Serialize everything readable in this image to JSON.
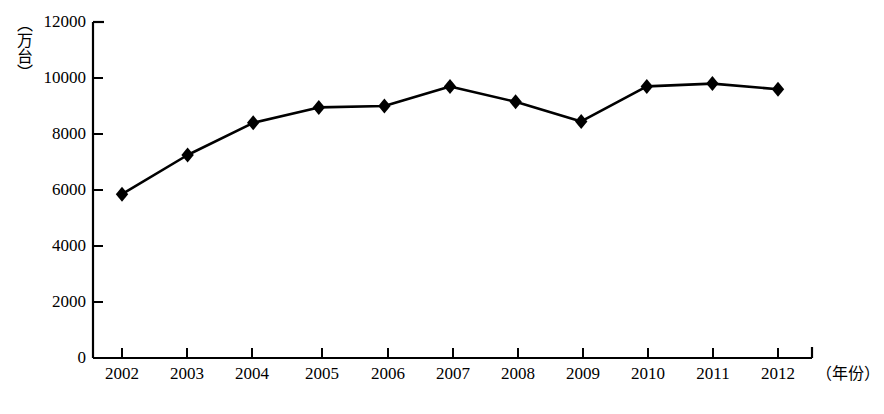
{
  "chart_data": {
    "type": "line",
    "title": "",
    "subtitle": "",
    "xlabel": "（年份）",
    "ylabel": "（万台）",
    "categories": [
      "2002",
      "2003",
      "2004",
      "2005",
      "2006",
      "2007",
      "2008",
      "2009",
      "2010",
      "2011",
      "2012"
    ],
    "values": [
      5850,
      7250,
      8400,
      8950,
      9000,
      9700,
      9150,
      8450,
      9700,
      9800,
      9600
    ],
    "series": [
      {
        "name": "产量",
        "values": [
          5850,
          7250,
          8400,
          8950,
          9000,
          9700,
          9150,
          8450,
          9700,
          9800,
          9600
        ]
      }
    ],
    "ylim": [
      0,
      12000
    ],
    "yticks": [
      0,
      2000,
      4000,
      6000,
      8000,
      10000,
      12000
    ],
    "ytick_labels": [
      "0",
      "2000",
      "4000",
      "6000",
      "8000",
      "10000",
      "12000"
    ],
    "grid": false,
    "legend": false,
    "legend_position": "none",
    "marker": "diamond",
    "line_color": "#000000",
    "marker_color": "#000000",
    "background_color": "#ffffff"
  },
  "axes": {
    "y_unit_label": "（万台）",
    "x_axis_title": "（年份）"
  }
}
